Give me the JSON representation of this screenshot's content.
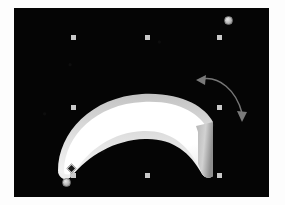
{
  "app": {
    "name": "vector-drawing-canvas",
    "background_color": "#ffffff",
    "canvas_color": "#050505"
  },
  "canvas": {
    "label": "drawing-canvas",
    "x": 14,
    "y": 8,
    "width": 255,
    "height": 189
  },
  "shape": {
    "name": "banana-shape",
    "type": "crescent",
    "fill_color": "#ffffff",
    "shade_color": "#bdbdbd",
    "midtone_color": "#d9d9d9",
    "stem_color": "#9c9c9c",
    "outline_color": "#cfcfcf"
  },
  "selection": {
    "label": "selection-handles",
    "handle_color": "#c9c9c9",
    "handle_size": 5,
    "handles": [
      {
        "name": "handle-top-left",
        "x": 57,
        "y": 27
      },
      {
        "name": "handle-top-center",
        "x": 131,
        "y": 27
      },
      {
        "name": "handle-top-right",
        "x": 203,
        "y": 27
      },
      {
        "name": "handle-middle-left",
        "x": 57,
        "y": 97
      },
      {
        "name": "handle-middle-right",
        "x": 203,
        "y": 97
      },
      {
        "name": "handle-bottom-left",
        "x": 57,
        "y": 165
      },
      {
        "name": "handle-bottom-center",
        "x": 131,
        "y": 165
      },
      {
        "name": "handle-bottom-right",
        "x": 203,
        "y": 165
      }
    ],
    "rotation_handle": {
      "name": "rotation-handle-top-right",
      "x": 210,
      "y": 8,
      "color": "#c4c4c4"
    },
    "pivot_handle": {
      "name": "rotation-pivot-handle",
      "x": 48,
      "y": 170,
      "color": "#bdbdbd"
    },
    "anchor_handle": {
      "name": "anchor-diamond-handle",
      "x": 54,
      "y": 157,
      "color": "#d0d0d0"
    }
  },
  "rotate_indicator": {
    "name": "rotation-arrow",
    "color": "#6e6e6e",
    "direction": "bidirectional",
    "head_left": {
      "x": 183,
      "y": 72
    },
    "head_right": {
      "x": 227,
      "y": 112
    }
  }
}
